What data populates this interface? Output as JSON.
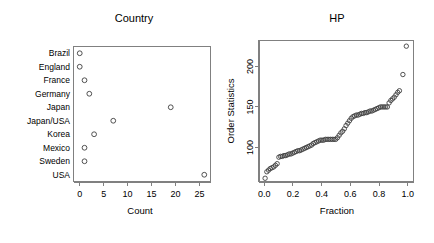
{
  "figure": {
    "background_color": "#ffffff",
    "foreground_color": "#000000",
    "point_stroke_color": "#404040",
    "frame_color": "#808080",
    "panels": 2
  },
  "chart_data": [
    {
      "type": "scatter",
      "name": "country-dotchart",
      "title": "Country",
      "xlabel": "Count",
      "ylabel": "",
      "categories": [
        "Brazil",
        "England",
        "France",
        "Germany",
        "Japan",
        "Japan/USA",
        "Korea",
        "Mexico",
        "Sweden",
        "USA"
      ],
      "values": [
        0,
        0,
        1,
        2,
        19,
        7,
        3,
        1,
        1,
        26
      ],
      "xticks": [
        0,
        5,
        10,
        15,
        20,
        25
      ],
      "xticklabels": [
        "0",
        "5",
        "10",
        "15",
        "20",
        "25"
      ],
      "xlim": [
        -1.3,
        27.3
      ],
      "grid": false,
      "legend": "none",
      "orientation": "horizontal-categorical"
    },
    {
      "type": "scatter",
      "name": "hp-order-statistics-plot",
      "title": "HP",
      "xlabel": "Fraction",
      "ylabel": "Order Statistics",
      "xticks": [
        0.0,
        0.2,
        0.4,
        0.6,
        0.8,
        1.0
      ],
      "xticklabels": [
        "0.0",
        "0.2",
        "0.4",
        "0.6",
        "0.8",
        "1.0"
      ],
      "yticks": [
        100,
        150,
        200
      ],
      "yticklabels": [
        "100",
        "150",
        "200"
      ],
      "xlim": [
        -0.04,
        1.04
      ],
      "ylim": [
        58,
        232
      ],
      "grid": false,
      "legend": "none",
      "x": [
        0.006,
        0.018,
        0.03,
        0.042,
        0.054,
        0.066,
        0.078,
        0.09,
        0.102,
        0.114,
        0.126,
        0.138,
        0.15,
        0.162,
        0.174,
        0.186,
        0.198,
        0.21,
        0.222,
        0.234,
        0.246,
        0.258,
        0.27,
        0.282,
        0.294,
        0.306,
        0.318,
        0.33,
        0.342,
        0.354,
        0.366,
        0.378,
        0.39,
        0.402,
        0.414,
        0.426,
        0.438,
        0.45,
        0.462,
        0.474,
        0.486,
        0.498,
        0.51,
        0.522,
        0.534,
        0.546,
        0.558,
        0.57,
        0.582,
        0.594,
        0.606,
        0.618,
        0.63,
        0.642,
        0.654,
        0.666,
        0.678,
        0.69,
        0.702,
        0.714,
        0.726,
        0.738,
        0.75,
        0.762,
        0.774,
        0.786,
        0.798,
        0.81,
        0.822,
        0.834,
        0.846,
        0.858,
        0.87,
        0.882,
        0.894,
        0.906,
        0.918,
        0.93,
        0.942,
        0.966,
        0.99
      ],
      "y": [
        62,
        70,
        72,
        74,
        75,
        76,
        78,
        80,
        88,
        89,
        89,
        90,
        90,
        91,
        92,
        92,
        93,
        94,
        95,
        96,
        96,
        97,
        98,
        99,
        100,
        101,
        102,
        103,
        105,
        106,
        107,
        108,
        109,
        109,
        109,
        110,
        110,
        110,
        110,
        110,
        110,
        110,
        112,
        115,
        118,
        120,
        123,
        127,
        130,
        133,
        136,
        138,
        139,
        140,
        140,
        141,
        142,
        142,
        143,
        143,
        144,
        145,
        145,
        146,
        147,
        148,
        149,
        150,
        150,
        150,
        150,
        150,
        155,
        158,
        160,
        162,
        165,
        168,
        170,
        190,
        225
      ]
    }
  ]
}
